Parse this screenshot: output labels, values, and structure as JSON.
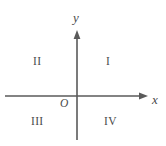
{
  "figure": {
    "type": "cartesian-coordinate-plane",
    "background_color": "#ffffff",
    "line_color": "#5a5a5a",
    "text_color": "#4a4a4a"
  },
  "axes": {
    "x": {
      "label": "x",
      "arrow_direction": "right",
      "start_px": 5,
      "end_px": 148,
      "y_px": 96
    },
    "y": {
      "label": "y",
      "arrow_direction": "up",
      "start_px": 140,
      "end_px": 30,
      "x_px": 77
    }
  },
  "origin": {
    "label": "O",
    "x_px": 77,
    "y_px": 96
  },
  "quadrants": [
    {
      "label": "I",
      "name": "quadrant-one",
      "x_px": 110,
      "y_px": 62
    },
    {
      "label": "II",
      "name": "quadrant-two",
      "x_px": 38,
      "y_px": 62
    },
    {
      "label": "III",
      "name": "quadrant-three",
      "x_px": 35,
      "y_px": 122
    },
    {
      "label": "IV",
      "name": "quadrant-four",
      "x_px": 110,
      "y_px": 122
    }
  ]
}
